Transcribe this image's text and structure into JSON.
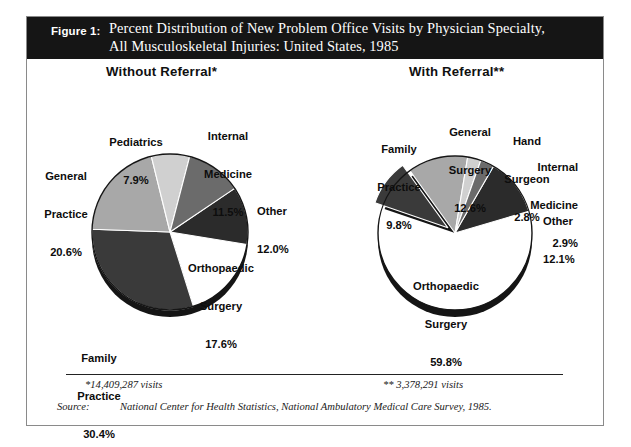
{
  "figure": {
    "number_label": "Figure 1:",
    "title_line1": "Percent Distribution of New Problem Office Visits by Physician Specialty,",
    "title_line2": "All Musculoskeletal Injuries:  United States, 1985"
  },
  "panels": {
    "left_heading": "Without Referral*",
    "right_heading": "With Referral**"
  },
  "footnotes": {
    "left": "*14,409,287 visits",
    "right": "** 3,378,291 visits",
    "source_label": "Source:",
    "source_text": "National Center for Health Statistics, National Ambulatory Medical Care Survey, 1985."
  },
  "colors": {
    "white_slice": "#ffffff",
    "very_dark": "#2b2b2b",
    "dark": "#3a3a3a",
    "mid_dark": "#6b6b6b",
    "mid": "#8f8f8f",
    "mid_light": "#a8a8a8",
    "light": "#d0d0d0",
    "outline": "#151515",
    "header_bg": "#151515",
    "frame": "#8a8a8a"
  },
  "chart_data": [
    {
      "type": "pie",
      "title": "Without Referral*",
      "total_label": "*14,409,287 visits",
      "categories": [
        "Other",
        "Orthopaedic Surgery",
        "Family Practice",
        "General Practice",
        "Pediatrics",
        "Internal Medicine"
      ],
      "values": [
        12.0,
        17.6,
        30.4,
        20.6,
        7.9,
        11.5
      ],
      "labels": [
        {
          "name": "Other",
          "value": "12.0%"
        },
        {
          "name": "Orthopaedic\nSurgery",
          "value": "17.6%"
        },
        {
          "name": "Family\nPractice",
          "value": "30.4%"
        },
        {
          "name": "General\nPractice",
          "value": "20.6%"
        },
        {
          "name": "Pediatrics",
          "value": "7.9%"
        },
        {
          "name": "Internal\nMedicine",
          "value": "11.5%"
        }
      ],
      "slice_colors": [
        "#2b2b2b",
        "#ffffff",
        "#3a3a3a",
        "#a8a8a8",
        "#d0d0d0",
        "#6b6b6b"
      ],
      "legend": "none",
      "units": "percent"
    },
    {
      "type": "pie",
      "title": "With Referral**",
      "total_label": "** 3,378,291 visits",
      "categories": [
        "Other",
        "Orthopaedic Surgery",
        "Family Practice",
        "General Surgery",
        "Hand Surgeon",
        "Internal Medicine"
      ],
      "values": [
        12.1,
        59.8,
        9.8,
        12.6,
        2.8,
        2.9
      ],
      "labels": [
        {
          "name": "Other",
          "value": "12.1%"
        },
        {
          "name": "Orthopaedic\nSurgery",
          "value": "59.8%"
        },
        {
          "name": "Family\nPractice",
          "value": "9.8%"
        },
        {
          "name": "General\nSurgery",
          "value": "12.6%"
        },
        {
          "name": "Hand\nSurgeon",
          "value": "2.8%"
        },
        {
          "name": "Internal\nMedicine",
          "value": "2.9%"
        }
      ],
      "slice_colors": [
        "#2b2b2b",
        "#ffffff",
        "#3a3a3a",
        "#a8a8a8",
        "#d0d0d0",
        "#6b6b6b"
      ],
      "legend": "none",
      "units": "percent"
    }
  ],
  "left_labels": {
    "pediatrics_name": "Pediatrics",
    "pediatrics_value": "7.9%",
    "internal_name1": "Internal",
    "internal_name2": "Medicine",
    "internal_value": "11.5%",
    "general_name1": "General",
    "general_name2": "Practice",
    "general_value": "20.6%",
    "other_name": "Other",
    "other_value": "12.0%",
    "ortho_name1": "Orthopaedic",
    "ortho_name2": "Surgery",
    "ortho_value": "17.6%",
    "family_name1": "Family",
    "family_name2": "Practice",
    "family_value": "30.4%"
  },
  "right_labels": {
    "family_name1": "Family",
    "family_name2": "Practice",
    "family_value": "9.8%",
    "gensurg_name1": "General",
    "gensurg_name2": "Surgery",
    "gensurg_value": "12.6%",
    "hand_name1": "Hand",
    "hand_name2": "Surgeon",
    "hand_value": "2.8%",
    "internal_name1": "Internal",
    "internal_name2": "Medicine",
    "internal_value": "2.9%",
    "other_name": "Other",
    "other_value": "12.1%",
    "ortho_name1": "Orthopaedic",
    "ortho_name2": "Surgery",
    "ortho_value": "59.8%"
  }
}
